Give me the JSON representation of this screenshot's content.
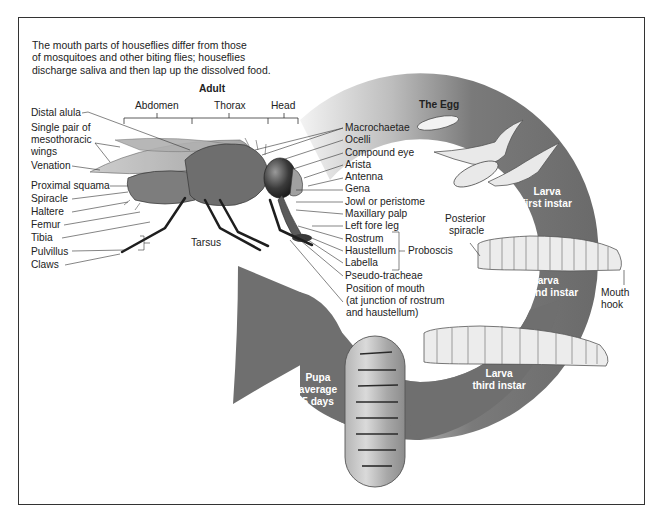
{
  "intro": {
    "lines": [
      "The mouth parts of houseflies differ from those",
      "of mosquitoes and other biting flies; houseflies",
      "discharge saliva and then lap up the dissolved food."
    ]
  },
  "adult": {
    "title": "Adult",
    "regions": [
      "Abdomen",
      "Thorax",
      "Head"
    ],
    "left_labels": {
      "distal_alula": "Distal alula",
      "wings_1": "Single pair of",
      "wings_2": "mesothoracic",
      "wings_3": "wings",
      "venation": "Venation",
      "proximal_squama": "Proximal squama",
      "spiracle": "Spiracle",
      "haltere": "Haltere",
      "femur": "Femur",
      "tibia": "Tibia",
      "pulvillus": "Pulvillus",
      "claws": "Claws",
      "tarsus": "Tarsus"
    },
    "right_labels": {
      "macrochaetae": "Macrochaetae",
      "ocelli": "Ocelli",
      "compound_eye": "Compound eye",
      "arista": "Arista",
      "antenna": "Antenna",
      "gena": "Gena",
      "jowl": "Jowl or peristome",
      "maxillary_palp": "Maxillary palp",
      "left_fore_leg": "Left fore leg",
      "rostrum": "Rostrum",
      "haustellum": "Haustellum",
      "labella": "Labella",
      "proboscis": "Proboscis",
      "pseudo_tracheae": "Pseudo-tracheae",
      "mouth_1": "Position of mouth",
      "mouth_2": "(at junction of rostrum",
      "mouth_3": "and haustellum)"
    }
  },
  "life_cycle": {
    "egg": "The Egg",
    "larva1_1": "Larva",
    "larva1_2": "first instar",
    "posterior_spiracle_1": "Posterior",
    "posterior_spiracle_2": "spiracle",
    "larva2_1": "Larva",
    "larva2_2": "second instar",
    "mouth_hook_1": "Mouth",
    "mouth_hook_2": "hook",
    "larva3_1": "Larva",
    "larva3_2": "third instar",
    "pupa_1": "Pupa",
    "pupa_2": "average",
    "pupa_3": "5 days"
  },
  "colors": {
    "ring": "#6f6f6f",
    "body": "#7d7d7d",
    "larva": "#ececec",
    "frame": "#333333"
  }
}
